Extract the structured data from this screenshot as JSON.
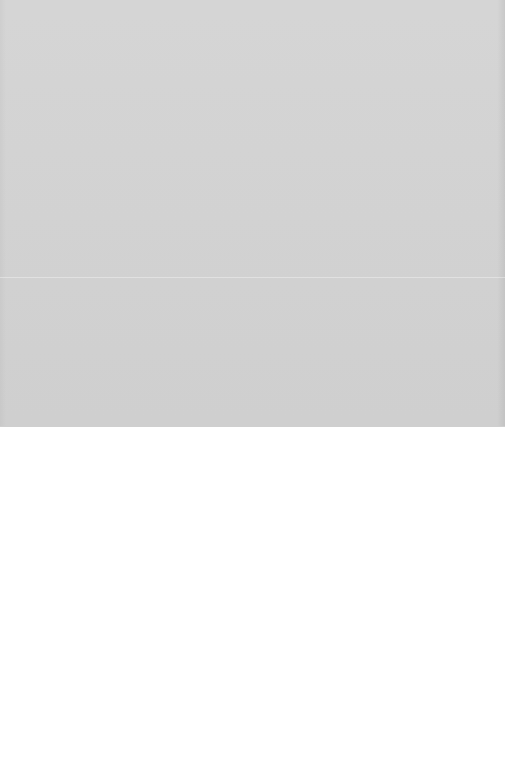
{
  "media": {
    "state": "placeholder",
    "icon": "none",
    "color": "#d3d3d3"
  },
  "content": {
    "background": "#ffffff"
  }
}
